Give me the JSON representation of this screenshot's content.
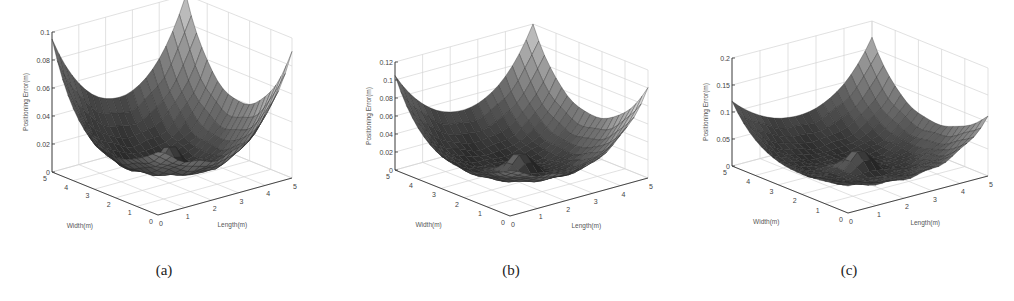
{
  "figure": {
    "captions": [
      "(a)",
      "(b)",
      "(c)"
    ]
  },
  "chart_data": [
    {
      "type": "surface3d",
      "id": "a",
      "caption": "(a)",
      "xlabel": "Length(m)",
      "ylabel": "Width(m)",
      "zlabel": "Positioning Error(m)",
      "xticks": [
        "0",
        "1",
        "2",
        "3",
        "4",
        "5"
      ],
      "yticks": [
        "0",
        "1",
        "2",
        "3",
        "4",
        "5"
      ],
      "zticks": [
        "0",
        "0.02",
        "0.04",
        "0.06",
        "0.08",
        "0.1"
      ],
      "xlim": [
        0,
        5
      ],
      "ylim": [
        0,
        5
      ],
      "zlim": [
        0,
        0.1
      ],
      "grid": true,
      "corner_values": {
        "x0y0": 0.045,
        "x5y0": 0.09,
        "x0y5": 0.095,
        "x5y5": 0.1
      },
      "center_min": 0.005,
      "center_bump": 0.02
    },
    {
      "type": "surface3d",
      "id": "b",
      "caption": "(b)",
      "xlabel": "Length(m)",
      "ylabel": "Width(m)",
      "zlabel": "Positioning Error(m)",
      "xticks": [
        "0",
        "1",
        "2",
        "3",
        "4",
        "5"
      ],
      "yticks": [
        "0",
        "1",
        "2",
        "3",
        "4",
        "5"
      ],
      "zticks": [
        "0",
        "0.02",
        "0.04",
        "0.06",
        "0.08",
        "0.1",
        "0.12"
      ],
      "xlim": [
        0,
        5
      ],
      "ylim": [
        0,
        5
      ],
      "zlim": [
        0,
        0.12
      ],
      "grid": true,
      "corner_values": {
        "x0y0": 0.05,
        "x5y0": 0.1,
        "x0y5": 0.105,
        "x5y5": 0.12
      },
      "center_min": 0.005,
      "center_bump": 0.025
    },
    {
      "type": "surface3d",
      "id": "c",
      "caption": "(c)",
      "xlabel": "Length(m)",
      "ylabel": "Width(m)",
      "zlabel": "Positioning Error(m)",
      "xticks": [
        "0",
        "1",
        "2",
        "3",
        "4",
        "5"
      ],
      "yticks": [
        "0",
        "1",
        "2",
        "3",
        "4",
        "5"
      ],
      "zticks": [
        "0",
        "0.05",
        "0.1",
        "0.15",
        "0.2"
      ],
      "xlim": [
        0,
        5
      ],
      "ylim": [
        0,
        5
      ],
      "zlim": [
        0,
        0.2
      ],
      "grid": true,
      "corner_values": {
        "x0y0": 0.05,
        "x5y0": 0.11,
        "x0y5": 0.12,
        "x5y5": 0.17
      },
      "center_min": 0.01,
      "center_bump": 0.04
    }
  ]
}
